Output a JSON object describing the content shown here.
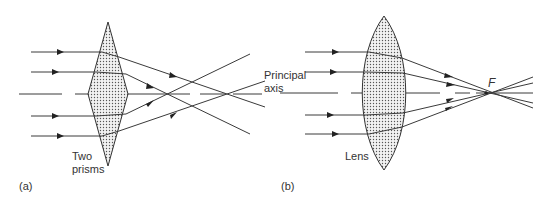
{
  "figure": {
    "panel_a": {
      "tag": "(a)",
      "prism_label_line1": "Two",
      "prism_label_line2": "prisms",
      "axis_label_line1": "Principal",
      "axis_label_line2": "axis"
    },
    "panel_b": {
      "tag": "(b)",
      "lens_label": "Lens",
      "focus_label": "F"
    },
    "colors": {
      "line": "#3a3a3a",
      "fill_dots": "#555555",
      "background": "#ffffff"
    }
  }
}
